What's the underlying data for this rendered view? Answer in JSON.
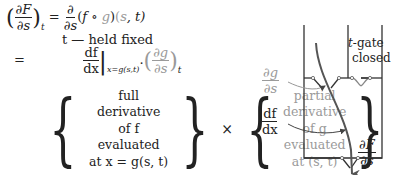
{
  "equation": {
    "lhs": {
      "numerator": "∂F",
      "denominator": "∂s",
      "subscript": "t"
    },
    "eq1": "=",
    "rhs1": {
      "numerator": "∂",
      "denominator": "∂s",
      "f": "f",
      "circ": " ∘ ",
      "g": "g",
      "args_open": "(",
      "s": "s",
      "comma_t": ", t)"
    },
    "held_note": "t — held fixed",
    "eq2": "=",
    "rhs2": {
      "df": {
        "numerator": "df",
        "denominator": "dx"
      },
      "eval_bar": "|",
      "eval_at": "x=g(s,t)",
      "dot": ".",
      "dg": {
        "numerator": "∂g",
        "denominator": "∂s",
        "subscript": "t"
      }
    }
  },
  "explanation": {
    "left_lines": [
      "full",
      "derivative",
      "of f",
      "evaluated",
      "at x = g(s, t)"
    ],
    "times": "×",
    "right_lines": [
      "partial",
      "derivative",
      "of g",
      "evaluated",
      "at (s, t)"
    ]
  },
  "circuit": {
    "gate_label_line1": "t-gate",
    "gate_label_line2": "closed",
    "input_dg": {
      "numerator": "∂g",
      "denominator": "∂s"
    },
    "input_df": {
      "numerator": "df",
      "denominator": "dx"
    },
    "output": {
      "numerator": "∂F",
      "denominator": "∂s"
    }
  },
  "colors": {
    "ink": "#222222",
    "gray": "#9a9a9a",
    "arrow": "#555555"
  }
}
